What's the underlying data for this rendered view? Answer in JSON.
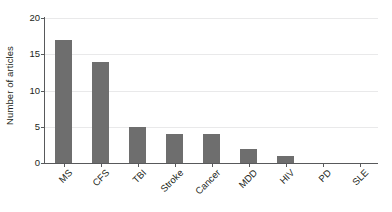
{
  "chart_data": {
    "type": "bar",
    "title": "",
    "xlabel": "",
    "ylabel": "Number of articles",
    "categories": [
      "MS",
      "CFS",
      "TBI",
      "Stroke",
      "Cancer",
      "MDD",
      "HIV",
      "PD",
      "SLE"
    ],
    "values": [
      17,
      14,
      5,
      4,
      4,
      2,
      1,
      0,
      0
    ],
    "ylim": [
      0,
      20
    ],
    "yticks": [
      0,
      5,
      10,
      15,
      20
    ],
    "ytick_labels": [
      "0",
      "5",
      "10",
      "15",
      "20"
    ],
    "grid": true,
    "legend": false,
    "bar_color": "#6e6e6e",
    "gridline_color": "#e9e9ea",
    "axis_color": "#58595b",
    "text_color": "#231f20",
    "background": "#ffffff"
  }
}
